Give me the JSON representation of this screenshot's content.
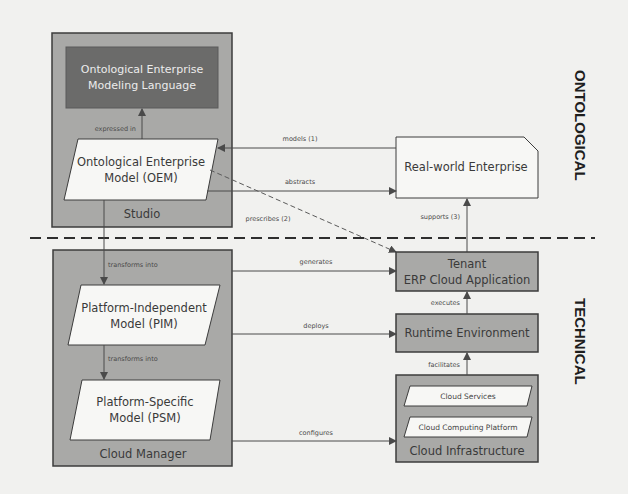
{
  "diagram": {
    "layers": {
      "top": "ONTOLOGICAL",
      "bottom": "TECHNICAL"
    },
    "studio": {
      "title": "Studio",
      "language": [
        "Ontological Enterprise",
        "Modeling Language"
      ],
      "oem": [
        "Ontological Enterprise",
        "Model (OEM)"
      ],
      "expressed_in": "expressed in"
    },
    "cloud_manager": {
      "title": "Cloud Manager",
      "pim": [
        "Platform-Independent",
        "Model (PIM)"
      ],
      "psm": [
        "Platform-Specific",
        "Model (PSM)"
      ],
      "transforms_into_1": "transforms into",
      "transforms_into_2": "transforms into"
    },
    "real_world": "Real-world Enterprise",
    "tenant": [
      "Tenant",
      "ERP Cloud Application"
    ],
    "runtime": "Runtime Environment",
    "infrastructure": {
      "title": "Cloud Infrastructure",
      "services": "Cloud Services",
      "platform": "Cloud Computing Platform"
    },
    "edges": {
      "models": "models (1)",
      "abstracts": "abstracts",
      "prescribes": "prescribes (2)",
      "supports": "supports (3)",
      "generates": "generates",
      "deploys": "deploys",
      "configures": "configures",
      "executes": "executes",
      "facilitates": "facilitates"
    },
    "colors": {
      "background": "#f1f1ef",
      "container": "#a9a9a7",
      "dark_box": "#6b6b6a",
      "light_shape": "#f7f7f5",
      "line": "#4a4a4a"
    }
  }
}
